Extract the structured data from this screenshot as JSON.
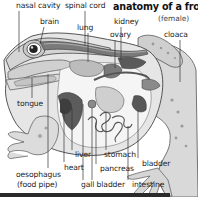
{
  "diagram": {
    "title": "anatomy of a frog",
    "subtitle": "(female)",
    "labels": [
      {
        "id": "nasal-cavity",
        "text": "nasal cavity",
        "x": 16,
        "y": 2
      },
      {
        "id": "brain",
        "text": "brain",
        "x": 40,
        "y": 18
      },
      {
        "id": "spinal-cord",
        "text": "spinal cord",
        "x": 65,
        "y": 2
      },
      {
        "id": "lung",
        "text": "lung",
        "x": 77,
        "y": 24
      },
      {
        "id": "kidney",
        "text": "kidney",
        "x": 114,
        "y": 18
      },
      {
        "id": "ovary",
        "text": "ovary",
        "x": 110,
        "y": 31
      },
      {
        "id": "cloaca",
        "text": "cloaca",
        "x": 164,
        "y": 31
      },
      {
        "id": "tongue",
        "text": "tongue",
        "x": 17,
        "y": 100
      },
      {
        "id": "oesophagus",
        "text": "oesophagus",
        "x": 16,
        "y": 171
      },
      {
        "id": "food-pipe",
        "text": "(food pipe)",
        "x": 17,
        "y": 181
      },
      {
        "id": "heart",
        "text": "heart",
        "x": 64,
        "y": 164
      },
      {
        "id": "liver",
        "text": "liver",
        "x": 75,
        "y": 151
      },
      {
        "id": "gall-bladder",
        "text": "gall bladder",
        "x": 81,
        "y": 181
      },
      {
        "id": "stomach",
        "text": "stomach",
        "x": 104,
        "y": 151
      },
      {
        "id": "pancreas",
        "text": "pancreas",
        "x": 100,
        "y": 165
      },
      {
        "id": "bladder",
        "text": "bladder",
        "x": 142,
        "y": 160
      },
      {
        "id": "intestine",
        "text": "intestine",
        "x": 132,
        "y": 181
      }
    ]
  },
  "colors": {
    "outline": "#444444",
    "skin": "#e2e2e2",
    "skin_dark": "#bdbdbd",
    "organ_dark": "#555555",
    "organ_mid": "#8a8a8a",
    "organ_light": "#c8c8c8",
    "cavity": "#f7f7f7",
    "leader": "#333333"
  }
}
